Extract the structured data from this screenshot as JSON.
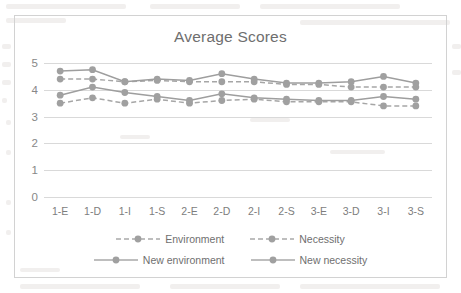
{
  "chart_data": {
    "type": "line",
    "title": "Average Scores",
    "xlabel": "",
    "ylabel": "",
    "ylim": [
      0,
      5
    ],
    "yticks": [
      0,
      1,
      2,
      3,
      4,
      5
    ],
    "grid": true,
    "legend_position": "bottom",
    "categories": [
      "1-E",
      "1-D",
      "1-I",
      "1-S",
      "2-E",
      "2-D",
      "2-I",
      "2-S",
      "3-E",
      "3-D",
      "3-I",
      "3-S"
    ],
    "series": [
      {
        "name": "Environment",
        "style": "dashed",
        "color": "#a6a6a6",
        "values": [
          4.4,
          4.4,
          4.3,
          4.35,
          4.3,
          4.3,
          4.3,
          4.2,
          4.2,
          4.1,
          4.1,
          4.1
        ]
      },
      {
        "name": "Necessity",
        "style": "dashed",
        "color": "#a6a6a6",
        "values": [
          3.5,
          3.7,
          3.5,
          3.65,
          3.5,
          3.6,
          3.65,
          3.55,
          3.55,
          3.55,
          3.4,
          3.4
        ]
      },
      {
        "name": "New environment",
        "style": "solid",
        "color": "#9e9e9e",
        "values": [
          4.7,
          4.75,
          4.3,
          4.4,
          4.35,
          4.6,
          4.4,
          4.25,
          4.25,
          4.3,
          4.5,
          4.25
        ]
      },
      {
        "name": "New necessity",
        "style": "solid",
        "color": "#9e9e9e",
        "values": [
          3.8,
          4.1,
          3.9,
          3.75,
          3.6,
          3.85,
          3.7,
          3.65,
          3.6,
          3.6,
          3.75,
          3.65
        ]
      }
    ]
  },
  "legend": {
    "items": [
      {
        "label": "Environment"
      },
      {
        "label": "Necessity"
      },
      {
        "label": "New environment"
      },
      {
        "label": "New necessity"
      }
    ]
  },
  "colors": {
    "series_marker": "#a0a0a0",
    "series_line": "#a9a9a9",
    "grid": "#d9d9d9",
    "axis_text": "#888888",
    "title_text": "#6e6e6e",
    "frame": "#d2d2d2"
  }
}
